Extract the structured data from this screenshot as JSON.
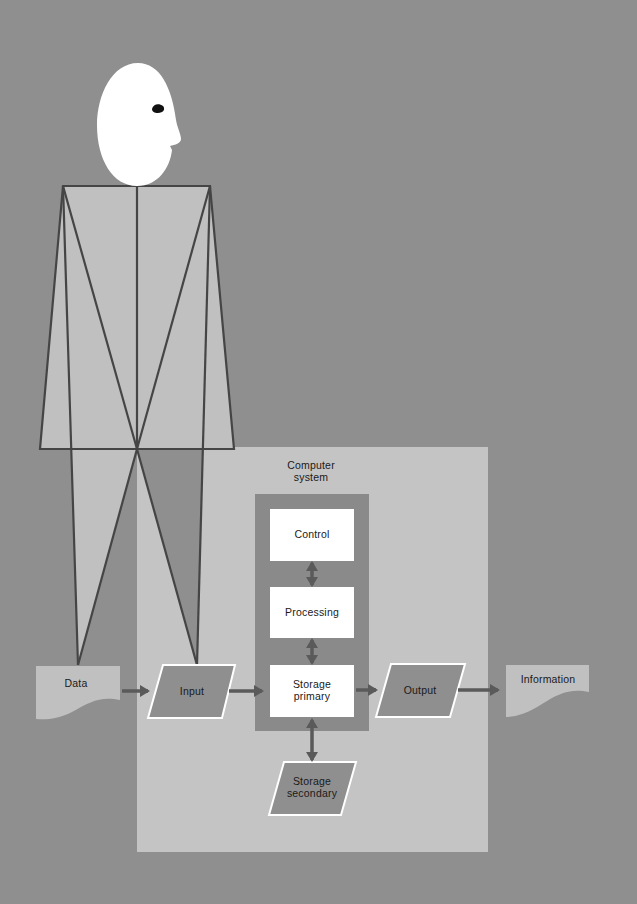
{
  "colors": {
    "background": "#8f8f8f",
    "panel": "#c4c4c4",
    "inner_column": "#8a8a8a",
    "figure_body": "#c0c0c0",
    "outline": "#454545",
    "box_fill": "#ffffff",
    "head": "#ffffff",
    "eye": "#111111",
    "arrow": "#5a5a5a"
  },
  "diagram": {
    "panel_label_line1": "Computer",
    "panel_label_line2": "system",
    "nodes": {
      "data": "Data",
      "input": "Input",
      "control": "Control",
      "processing": "Processing",
      "storage_primary_line1": "Storage",
      "storage_primary_line2": "primary",
      "output": "Output",
      "information": "Information",
      "storage_secondary_line1": "Storage",
      "storage_secondary_line2": "secondary"
    },
    "edges": [
      {
        "from": "Data",
        "to": "Input",
        "type": "one-way"
      },
      {
        "from": "Input",
        "to": "Storage primary",
        "type": "one-way"
      },
      {
        "from": "Storage primary",
        "to": "Output",
        "type": "one-way"
      },
      {
        "from": "Output",
        "to": "Information",
        "type": "one-way"
      },
      {
        "from": "Control",
        "to": "Processing",
        "type": "two-way"
      },
      {
        "from": "Processing",
        "to": "Storage primary",
        "type": "two-way"
      },
      {
        "from": "Storage primary",
        "to": "Storage secondary",
        "type": "two-way"
      }
    ]
  }
}
